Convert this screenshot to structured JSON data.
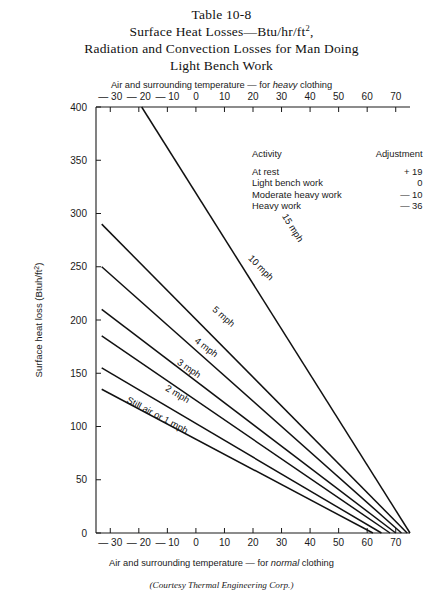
{
  "title": {
    "line1": "Table 10-8",
    "line2_pre": "Surface Heat Losses—Btu/hr/ft",
    "line2_sup": "2",
    "line2_post": ",",
    "line3": "Radiation and Convection Losses for Man Doing",
    "line4": "Light Bench Work"
  },
  "captions": {
    "top_pre": "Air and surrounding temperature — for ",
    "top_em": "heavy",
    "top_post": " clothing",
    "bottom_pre": "Air and surrounding temperature — for ",
    "bottom_em": "normal",
    "bottom_post": " clothing",
    "courtesy": "(Courtesy Thermal Engineering Corp.)"
  },
  "legend": {
    "header_activity": "Activity",
    "header_adjustment": "Adjustment",
    "rows": [
      {
        "activity": "At rest",
        "adjustment": "+ 19"
      },
      {
        "activity": "Light bench work",
        "adjustment": "0"
      },
      {
        "activity": "Moderate heavy work",
        "adjustment": "— 10"
      },
      {
        "activity": "Heavy work",
        "adjustment": "— 36"
      }
    ]
  },
  "chart_data": {
    "type": "line",
    "title": "Surface Heat Losses—Btu/hr/ft2, Radiation and Convection Losses for Man Doing Light Bench Work",
    "xlabel_bottom": "Air and surrounding temperature — for normal clothing",
    "xlabel_top": "Air and surrounding temperature — for heavy clothing",
    "ylabel": "Surface heat loss (Btuh/ft2)",
    "xlim": [
      -35,
      75
    ],
    "ylim": [
      0,
      400
    ],
    "grid": false,
    "legend_position": "upper-right-inside",
    "x_ticks_bottom": [
      -30,
      -20,
      -10,
      0,
      10,
      20,
      30,
      40,
      50,
      60,
      70
    ],
    "x_ticks_top": [
      -30,
      -20,
      -10,
      0,
      10,
      20,
      30,
      40,
      50,
      60,
      70
    ],
    "y_ticks": [
      0,
      50,
      100,
      150,
      200,
      250,
      300,
      350,
      400
    ],
    "x_tick_labels_bottom": [
      "— 30",
      "— 20",
      "— 10",
      "0",
      "10",
      "20",
      "30",
      "40",
      "50",
      "60",
      "70"
    ],
    "x_tick_labels_top": [
      "— 30",
      "— 20",
      "— 10",
      "0",
      "10",
      "20",
      "30",
      "40",
      "50",
      "60",
      "70"
    ],
    "y_tick_labels": [
      "0",
      "50",
      "100",
      "150",
      "200",
      "250",
      "300",
      "350",
      "400"
    ],
    "series": [
      {
        "name": "Still air or 1 mph",
        "label": "Still air or 1 mph",
        "points": [
          [
            -33,
            135
          ],
          [
            62,
            0
          ]
        ],
        "label_x": -14,
        "label_y": 108
      },
      {
        "name": "2 mph",
        "label": "2 mph",
        "points": [
          [
            -33,
            155
          ],
          [
            65,
            0
          ]
        ],
        "label_x": -7,
        "label_y": 128
      },
      {
        "name": "3 mph",
        "label": "3 mph",
        "points": [
          [
            -33,
            185
          ],
          [
            68,
            0
          ]
        ],
        "label_x": -3,
        "label_y": 152
      },
      {
        "name": "4 mph",
        "label": "4 mph",
        "points": [
          [
            -33,
            210
          ],
          [
            70,
            0
          ]
        ],
        "label_x": 3,
        "label_y": 172
      },
      {
        "name": "5 mph",
        "label": "5 mph",
        "points": [
          [
            -33,
            250
          ],
          [
            72,
            0
          ]
        ],
        "label_x": 9,
        "label_y": 201
      },
      {
        "name": "10 mph",
        "label": "10 mph",
        "points": [
          [
            -33,
            290
          ],
          [
            74,
            0
          ]
        ],
        "label_x": 22,
        "label_y": 247
      },
      {
        "name": "15 mph",
        "label": "15 mph",
        "points": [
          [
            -19,
            400
          ],
          [
            75,
            0
          ]
        ],
        "label_x": 33,
        "label_y": 285
      }
    ]
  }
}
